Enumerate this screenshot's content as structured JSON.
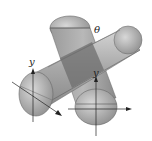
{
  "diagram": {
    "labels": {
      "theta": "θ",
      "y_left": "y",
      "y_right": "y"
    },
    "colors": {
      "cylinder_light": "#c8c8c8",
      "cylinder_mid": "#a0a0a0",
      "cylinder_dark": "#7a7a7a",
      "overlap": "#6e6e6e",
      "axis": "#222222"
    }
  }
}
